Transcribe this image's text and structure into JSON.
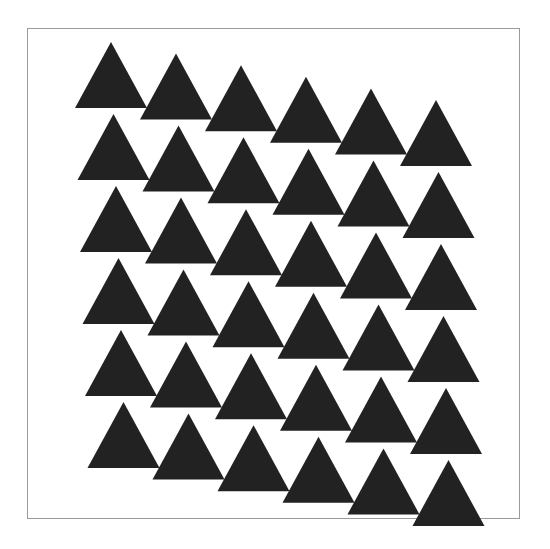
{
  "figure": {
    "frame": {
      "x": 27,
      "y": 28,
      "width": 493,
      "height": 491,
      "stroke": "#9a9a9a"
    },
    "triangle_fill": "#222222",
    "triangle_width": 72,
    "triangle_height": 66,
    "grid": {
      "rows": 6,
      "cols": 6,
      "origin_apex": [
        111,
        42
      ],
      "col_step": [
        65,
        11.6
      ],
      "row_step": [
        2.5,
        72
      ]
    }
  }
}
